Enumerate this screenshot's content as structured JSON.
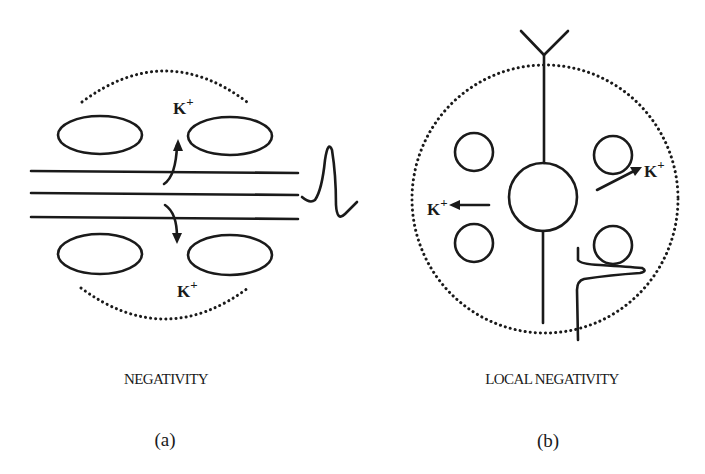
{
  "figure": {
    "panels": [
      {
        "id": "a",
        "caption": "NEGATIVITY",
        "label": "(a)",
        "ions": [
          {
            "symbol": "K",
            "charge": "+",
            "position": "top",
            "direction": "up"
          },
          {
            "symbol": "K",
            "charge": "+",
            "position": "bottom",
            "direction": "down"
          }
        ],
        "elements": [
          "dotted-boundary-top",
          "dotted-boundary-bottom",
          "glial-cell-ellipses-4",
          "parallel-fibers-3",
          "action-potential-waveform"
        ]
      },
      {
        "id": "b",
        "caption": "LOCAL NEGATIVITY",
        "label": "(b)",
        "ions": [
          {
            "symbol": "K",
            "charge": "+",
            "position": "left",
            "direction": "left"
          },
          {
            "symbol": "K",
            "charge": "+",
            "position": "right",
            "direction": "up-right"
          }
        ],
        "elements": [
          "dotted-boundary-circle",
          "dendrite-fork",
          "neuron-soma",
          "axon",
          "glial-cells-4",
          "local-potential-trace"
        ]
      }
    ],
    "ion_label": "K",
    "ion_charge": "+",
    "colors": {
      "ink": "#1a1a1a",
      "background": "#ffffff"
    }
  }
}
